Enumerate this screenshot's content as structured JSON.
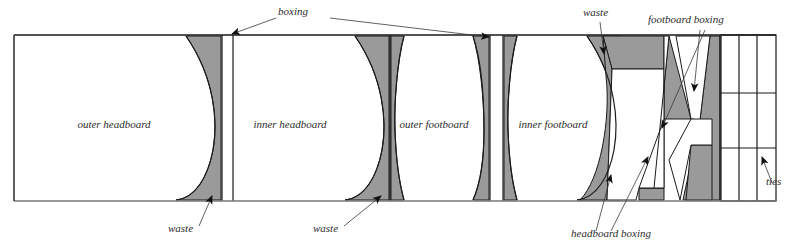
{
  "figure": {
    "colors": {
      "waste_fill": "#9a9a9a",
      "stock_fill": "#ffffff",
      "outline": "#1a1a1a",
      "leader": "#3a3a3a",
      "text": "#2b2b2b"
    },
    "frame": {
      "x": 14,
      "y": 35,
      "width": 762,
      "height": 166
    },
    "panels": [
      {
        "name": "outer-headboard",
        "label": "outer headboard",
        "label_x": 114,
        "label_y": 128,
        "x": 14,
        "y": 35,
        "width": 208
      },
      {
        "name": "inner-headboard",
        "label": "inner headboard",
        "label_x": 290,
        "label_y": 128,
        "x": 234,
        "y": 35,
        "width": 156
      },
      {
        "name": "outer-footboard",
        "label": "outer footboard",
        "label_x": 434,
        "label_y": 128,
        "x": 390,
        "y": 35,
        "width": 100
      },
      {
        "name": "inner-footboard",
        "label": "inner footboard",
        "label_x": 553,
        "label_y": 128,
        "x": 503,
        "y": 35,
        "width": 100
      }
    ],
    "callouts": [
      {
        "name": "boxing",
        "label": "boxing",
        "x": 278,
        "y": 15,
        "anchor": "start"
      },
      {
        "name": "waste-outer-headboard",
        "label": "waste",
        "x": 168,
        "y": 232,
        "anchor": "start"
      },
      {
        "name": "waste-inner-headboard",
        "label": "waste",
        "x": 313,
        "y": 232,
        "anchor": "start"
      },
      {
        "name": "waste-top-right",
        "label": "waste",
        "x": 583,
        "y": 16,
        "anchor": "start"
      },
      {
        "name": "footboard-boxing",
        "label": "footboard boxing",
        "x": 648,
        "y": 23,
        "anchor": "start"
      },
      {
        "name": "headboard-boxing",
        "label": "headboard boxing",
        "x": 571,
        "y": 237,
        "anchor": "start"
      },
      {
        "name": "ties",
        "label": "ties",
        "x": 766,
        "y": 185,
        "anchor": "start"
      }
    ],
    "ties_grid": {
      "name": "ties-grid",
      "x": 721,
      "y": 35,
      "width": 55,
      "height": 166,
      "columns": 3,
      "rows": 3,
      "col_lines": [
        739,
        757
      ],
      "row_lines": [
        93,
        148
      ]
    }
  }
}
